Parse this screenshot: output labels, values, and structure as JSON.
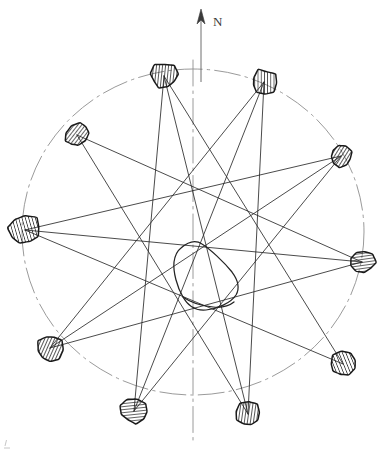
{
  "figure": {
    "background_color": "#ffffff",
    "line_color": "#2a2a2a",
    "reference_color": "#8e8e8e",
    "marker_fill": "#ffffff",
    "marker_stroke": "#1a1a1a",
    "hatch_color": "#1f1f1f"
  },
  "north_arrow": {
    "label": "N",
    "label_x": 213,
    "label_y": 26,
    "shaft_x": 201,
    "shaft_top_y": 16,
    "shaft_bottom_y": 82,
    "head_points": "201,9 197,24 201,20 205,24"
  },
  "reference_circle": {
    "name": "reference-circle",
    "center_x": 193,
    "center_y": 232,
    "radius_x": 171,
    "radius_y": 163,
    "style": "dash-dot"
  },
  "center_axis": {
    "name": "vertical-axis",
    "x": 193,
    "y_top": 60,
    "y_bottom": 444,
    "style": "dash-dot"
  },
  "central_outline": {
    "name": "central-closed-curve",
    "path": "M 181 248 C 189 241 196 240 202 244 C 210 249 224 262 232 272 C 238 280 240 288 236 295 C 231 303 217 309 206 310 C 196 311 188 306 183 297 C 177 287 173 272 174 262 C 175 255 177 251 181 248 Z",
    "path_secondary": "M 183 297 C 190 302 202 306 213 307 C 222 308 229 306 234 302"
  },
  "stations": [
    {
      "id": "S1",
      "name": "station-north-west-upper",
      "cx": 164,
      "cy": 76,
      "rx": 14,
      "ry": 13,
      "rot": -6,
      "size": "medium"
    },
    {
      "id": "S2",
      "name": "station-north-east-upper",
      "cx": 264,
      "cy": 82,
      "rx": 13,
      "ry": 13,
      "rot": 8,
      "size": "medium"
    },
    {
      "id": "S3",
      "name": "station-west-upper",
      "cx": 77,
      "cy": 135,
      "rx": 13,
      "ry": 10,
      "rot": -40,
      "size": "small"
    },
    {
      "id": "S4",
      "name": "station-east-upper",
      "cx": 341,
      "cy": 156,
      "rx": 11,
      "ry": 11,
      "rot": 20,
      "size": "small"
    },
    {
      "id": "S5",
      "name": "station-west-middle",
      "cx": 25,
      "cy": 230,
      "rx": 17,
      "ry": 15,
      "rot": -8,
      "size": "large"
    },
    {
      "id": "S6",
      "name": "station-east-middle",
      "cx": 362,
      "cy": 262,
      "rx": 13,
      "ry": 12,
      "rot": 4,
      "size": "medium"
    },
    {
      "id": "S7",
      "name": "station-west-lower",
      "cx": 50,
      "cy": 348,
      "rx": 13,
      "ry": 14,
      "rot": 12,
      "size": "medium"
    },
    {
      "id": "S8",
      "name": "station-east-lower",
      "cx": 343,
      "cy": 364,
      "rx": 13,
      "ry": 12,
      "rot": -14,
      "size": "medium"
    },
    {
      "id": "S9",
      "name": "station-south-west-lower",
      "cx": 134,
      "cy": 411,
      "rx": 14,
      "ry": 12,
      "rot": 6,
      "size": "medium"
    },
    {
      "id": "S10",
      "name": "station-south-east-lower",
      "cx": 248,
      "cy": 414,
      "rx": 13,
      "ry": 13,
      "rot": -4,
      "size": "medium"
    }
  ],
  "sight_lines": [
    {
      "from": "S1",
      "to": "S9"
    },
    {
      "from": "S1",
      "to": "S8"
    },
    {
      "from": "S2",
      "to": "S10"
    },
    {
      "from": "S2",
      "to": "S7"
    },
    {
      "from": "S3",
      "to": "S6"
    },
    {
      "from": "S3",
      "to": "S10"
    },
    {
      "from": "S4",
      "to": "S5"
    },
    {
      "from": "S4",
      "to": "S9"
    },
    {
      "from": "S5",
      "to": "S8"
    },
    {
      "from": "S5",
      "to": "S6"
    },
    {
      "from": "S6",
      "to": "S7"
    },
    {
      "from": "S7",
      "to": "S4"
    },
    {
      "from": "S9",
      "to": "S2"
    },
    {
      "from": "S10",
      "to": "S1"
    }
  ],
  "corner_mark": {
    "name": "corner-registration-tick",
    "x": 5,
    "y": 440
  }
}
